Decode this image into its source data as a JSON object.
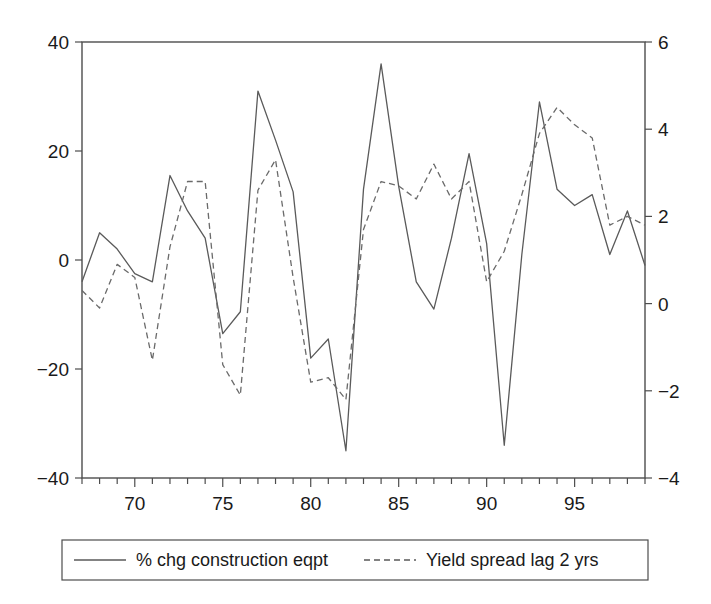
{
  "chart_data": {
    "type": "line",
    "title": "",
    "subtitle": "",
    "xlabel": "",
    "ylabel": "",
    "grid": false,
    "legend_position": "bottom",
    "x": [
      1967,
      1968,
      1969,
      1970,
      1971,
      1972,
      1973,
      1974,
      1975,
      1976,
      1977,
      1978,
      1979,
      1980,
      1981,
      1982,
      1983,
      1984,
      1985,
      1986,
      1987,
      1988,
      1989,
      1990,
      1991,
      1992,
      1993,
      1994,
      1995,
      1996,
      1997,
      1998,
      1999
    ],
    "x_tick_labels": [
      "70",
      "75",
      "80",
      "85",
      "90",
      "95"
    ],
    "x_tick_values": [
      1970,
      1975,
      1980,
      1985,
      1990,
      1995
    ],
    "xlim": [
      1967,
      1999
    ],
    "axes": [
      {
        "id": "left",
        "ylim": [
          -40,
          40
        ],
        "tick_labels": [
          "40",
          "20",
          "0",
          "−20",
          "−40"
        ],
        "tick_values": [
          40,
          20,
          0,
          -20,
          -40
        ]
      },
      {
        "id": "right",
        "ylim": [
          -4,
          6
        ],
        "tick_labels": [
          "6",
          "4",
          "2",
          "0",
          "−2",
          "−4"
        ],
        "tick_values": [
          6,
          4,
          2,
          0,
          -2,
          -4
        ]
      }
    ],
    "series": [
      {
        "name": "% chg construction eqpt",
        "axis": "left",
        "style": "solid",
        "color": "#5a5a5a",
        "values": [
          -4.0,
          5.0,
          2.0,
          -2.5,
          -4.0,
          15.5,
          9.0,
          4.0,
          -13.5,
          -9.5,
          31.0,
          22.0,
          12.5,
          -18.0,
          -14.5,
          -35.0,
          13.0,
          36.0,
          13.5,
          -4.0,
          -9.0,
          4.0,
          19.5,
          3.0,
          -34.0,
          1.0,
          29.0,
          13.0,
          10.0,
          12.0,
          1.0,
          9.0,
          -1.0
        ]
      },
      {
        "name": "Yield spread lag 2 yrs",
        "axis": "right",
        "style": "dashed",
        "color": "#6a6a6a",
        "values": [
          0.3,
          -0.1,
          0.9,
          0.6,
          -1.3,
          1.3,
          2.8,
          2.8,
          -1.4,
          -2.1,
          2.6,
          3.3,
          0.6,
          -1.8,
          -1.7,
          -2.2,
          1.7,
          2.8,
          2.7,
          2.4,
          3.2,
          2.4,
          2.8,
          0.5,
          1.2,
          2.5,
          3.9,
          4.5,
          4.1,
          3.8,
          1.8,
          2.0,
          1.8
        ]
      }
    ]
  },
  "legend": {
    "entries": [
      {
        "label": "% chg construction eqpt",
        "style": "solid"
      },
      {
        "label": "Yield spread lag 2 yrs",
        "style": "dashed"
      }
    ]
  }
}
